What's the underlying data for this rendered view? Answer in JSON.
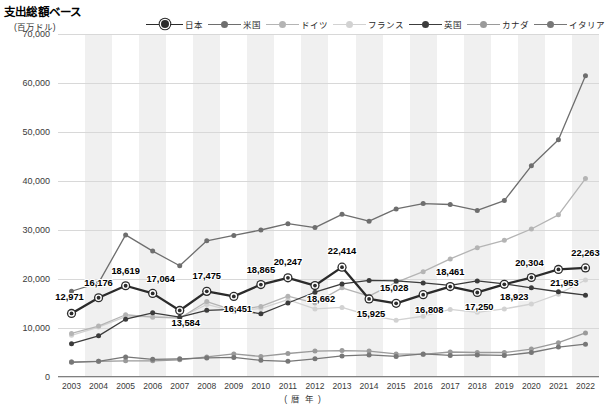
{
  "header": {
    "title": "支出総額ベース",
    "unit": "(百万ドル)"
  },
  "axis": {
    "x_title": "( 暦 年 )",
    "y_ticks": [
      "0",
      "10,000",
      "20,000",
      "30,000",
      "40,000",
      "50,000",
      "60,000",
      "70,000"
    ],
    "x_ticks": [
      "2003",
      "2004",
      "2005",
      "2006",
      "2007",
      "2008",
      "2009",
      "2010",
      "2011",
      "2012",
      "2013",
      "2014",
      "2015",
      "2016",
      "2017",
      "2018",
      "2019",
      "2020",
      "2021",
      "2022"
    ]
  },
  "legend": {
    "position": "top-right",
    "items": [
      {
        "label": "日本",
        "color": "#2b2b2b",
        "marker": "ring"
      },
      {
        "label": "米国",
        "color": "#6e6e6e",
        "marker": "dot"
      },
      {
        "label": "ドイツ",
        "color": "#b4b4b4",
        "marker": "dot"
      },
      {
        "label": "フランス",
        "color": "#d2d2d2",
        "marker": "dot"
      },
      {
        "label": "英国",
        "color": "#3c3c3c",
        "marker": "dot"
      },
      {
        "label": "カナダ",
        "color": "#9a9a9a",
        "marker": "dot"
      },
      {
        "label": "イタリア",
        "color": "#777777",
        "marker": "dot"
      }
    ]
  },
  "chart_data": {
    "type": "line",
    "title": "支出総額ベース",
    "xlabel": "( 暦 年 )",
    "ylabel": "(百万ドル)",
    "ylim": [
      0,
      70000
    ],
    "ytick_step": 10000,
    "grid": true,
    "legend_position": "top-right",
    "x": [
      "2003",
      "2004",
      "2005",
      "2006",
      "2007",
      "2008",
      "2009",
      "2010",
      "2011",
      "2012",
      "2013",
      "2014",
      "2015",
      "2016",
      "2017",
      "2018",
      "2019",
      "2020",
      "2021",
      "2022"
    ],
    "series": [
      {
        "name": "日本",
        "color": "#2b2b2b",
        "labeled": true,
        "values": [
          12971,
          16176,
          18619,
          17064,
          13584,
          17475,
          16451,
          18865,
          20247,
          18662,
          22414,
          15925,
          15028,
          16808,
          18461,
          17250,
          18923,
          20304,
          21953,
          22263
        ]
      },
      {
        "name": "米国",
        "color": "#6e6e6e",
        "labeled": false,
        "values": [
          17500,
          19200,
          29000,
          25700,
          22700,
          27800,
          28900,
          30000,
          31300,
          30500,
          33200,
          31800,
          34300,
          35400,
          35200,
          34000,
          36000,
          43100,
          48400,
          61500
        ]
      },
      {
        "name": "ドイツ",
        "color": "#b4b4b4",
        "labeled": false,
        "values": [
          8900,
          10400,
          12700,
          12200,
          12000,
          15400,
          13600,
          14400,
          16500,
          15100,
          18200,
          16500,
          19300,
          21500,
          24100,
          26400,
          27900,
          30200,
          33100,
          40500
        ]
      },
      {
        "name": "フランス",
        "color": "#d2d2d2",
        "labeled": false,
        "values": [
          8500,
          10200,
          12300,
          12400,
          12100,
          14800,
          13400,
          14000,
          15800,
          13900,
          14200,
          12600,
          11600,
          12400,
          13800,
          13200,
          13900,
          14900,
          16900,
          19800
        ]
      },
      {
        "name": "英国",
        "color": "#3c3c3c",
        "labeled": false,
        "values": [
          6800,
          8400,
          11800,
          13100,
          12200,
          13600,
          13800,
          12900,
          15100,
          17300,
          19000,
          19700,
          19600,
          19200,
          18700,
          19600,
          19000,
          18200,
          17400,
          16700
        ]
      },
      {
        "name": "カナダ",
        "color": "#9a9a9a",
        "labeled": false,
        "values": [
          3100,
          3200,
          3300,
          3300,
          3500,
          4100,
          4700,
          4200,
          4800,
          5300,
          5400,
          5300,
          4700,
          4600,
          5100,
          5000,
          5000,
          5700,
          7000,
          9000
        ]
      },
      {
        "name": "イタリア",
        "color": "#777777",
        "labeled": false,
        "values": [
          3000,
          3200,
          4100,
          3600,
          3700,
          3900,
          4000,
          3400,
          3200,
          3700,
          4300,
          4500,
          4200,
          4700,
          4400,
          4500,
          4400,
          5000,
          6100,
          6700
        ]
      }
    ],
    "data_labels": [
      {
        "year": "2003",
        "value": "12,971"
      },
      {
        "year": "2004",
        "value": "16,176"
      },
      {
        "year": "2005",
        "value": "18,619"
      },
      {
        "year": "2006",
        "value": "17,064"
      },
      {
        "year": "2007",
        "value": "13,584"
      },
      {
        "year": "2008",
        "value": "17,475"
      },
      {
        "year": "2009",
        "value": "16,451"
      },
      {
        "year": "2010",
        "value": "18,865"
      },
      {
        "year": "2011",
        "value": "20,247"
      },
      {
        "year": "2012",
        "value": "18,662"
      },
      {
        "year": "2013",
        "value": "22,414"
      },
      {
        "year": "2014",
        "value": "15,925"
      },
      {
        "year": "2015",
        "value": "15,028"
      },
      {
        "year": "2016",
        "value": "16,808"
      },
      {
        "year": "2017",
        "value": "18,461"
      },
      {
        "year": "2018",
        "value": "17,250"
      },
      {
        "year": "2019",
        "value": "18,923"
      },
      {
        "year": "2020",
        "value": "20,304"
      },
      {
        "year": "2021",
        "value": "21,953"
      },
      {
        "year": "2022",
        "value": "22,263"
      }
    ]
  }
}
